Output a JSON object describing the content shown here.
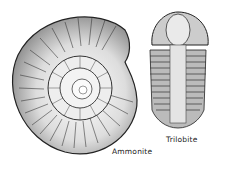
{
  "labels": {
    "ammonite": "Ammonite",
    "trilobite": "Trilobite"
  }
}
